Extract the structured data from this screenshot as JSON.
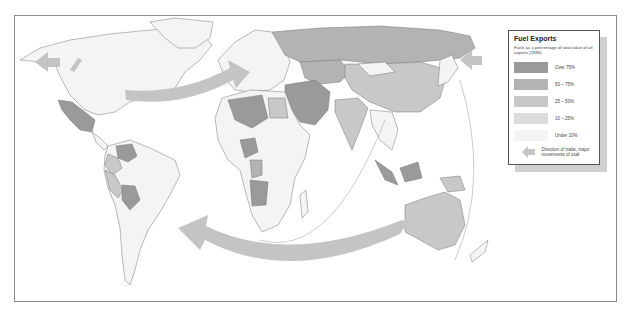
{
  "legend": {
    "title": "Fuel Exports",
    "subtitle": "Fuels as a percentage of total value of all exports (1986)",
    "classes": [
      {
        "label": "Over 75%",
        "color": "#9a9a9a"
      },
      {
        "label": "50 – 75%",
        "color": "#b3b3b3"
      },
      {
        "label": "25 – 50%",
        "color": "#c8c8c8"
      },
      {
        "label": "10 – 25%",
        "color": "#dcdcdc"
      },
      {
        "label": "Under 10%",
        "color": "#f4f4f4"
      }
    ],
    "arrow_label": "Direction of trade, major movements of coal",
    "arrow_color": "#c4c4c4"
  },
  "map": {
    "background": "#ffffff",
    "border_color": "#8a8a8a",
    "land_outline": "#777777",
    "regions": [
      {
        "name": "North America",
        "class": "Under 10%"
      },
      {
        "name": "Mexico",
        "class": "Over 75%"
      },
      {
        "name": "Venezuela",
        "class": "Over 75%"
      },
      {
        "name": "Bolivia",
        "class": "Over 75%"
      },
      {
        "name": "Russia",
        "class": "50 – 75%"
      },
      {
        "name": "China",
        "class": "25 – 50%"
      },
      {
        "name": "Middle East",
        "class": "Over 75%"
      },
      {
        "name": "Algeria/Libya",
        "class": "Over 75%"
      },
      {
        "name": "Nigeria",
        "class": "Over 75%"
      },
      {
        "name": "Angola",
        "class": "Over 75%"
      },
      {
        "name": "Australia",
        "class": "25 – 50%"
      },
      {
        "name": "Indonesia/Borneo",
        "class": "Over 75%"
      },
      {
        "name": "India",
        "class": "25 – 50%"
      }
    ]
  }
}
